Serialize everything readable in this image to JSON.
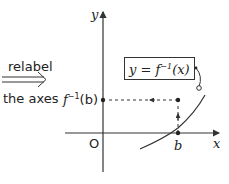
{
  "transition": {
    "top_label": "relabel",
    "bottom_label": "the axes",
    "arrow_icon": "double-right-arrow"
  },
  "axes": {
    "x_label": "x",
    "y_label": "y",
    "origin_label": "O"
  },
  "curve_label": {
    "text_prefix": "y = f",
    "superscript": "−1",
    "text_suffix": "(x)"
  },
  "point_labels": {
    "y_value_prefix": "f",
    "y_value_superscript": "−1",
    "y_value_suffix": "(b)",
    "x_value": "b"
  },
  "colors": {
    "stroke": "#333333",
    "text": "#222222"
  }
}
